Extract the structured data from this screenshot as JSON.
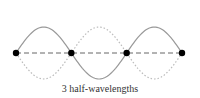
{
  "caption": "3 half-wavelengths",
  "half_wavelengths": 3,
  "node_count": 4,
  "colors": {
    "wave": "#999999",
    "axis": "#666666",
    "node": "#000000"
  }
}
